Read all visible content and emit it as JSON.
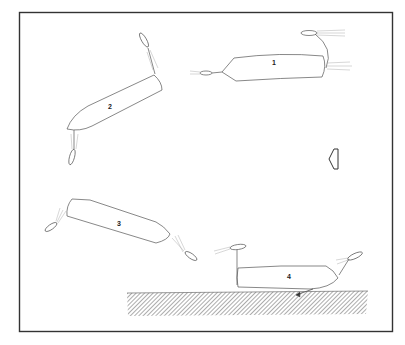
{
  "diagram": {
    "frame": {
      "x": 19,
      "y": 12,
      "w": 374,
      "h": 320,
      "stroke": "#333333"
    },
    "line_color": "#555555",
    "vessels": [
      {
        "id": "1",
        "label": "1"
      },
      {
        "id": "2",
        "label": "2"
      },
      {
        "id": "3",
        "label": "3"
      },
      {
        "id": "4",
        "label": "4"
      }
    ],
    "direction_arrow": {
      "icon": "left-arrow-outline-icon",
      "direction": "left"
    },
    "seabed": {
      "pattern": "diagonal-hatch",
      "color": "#777777"
    }
  }
}
